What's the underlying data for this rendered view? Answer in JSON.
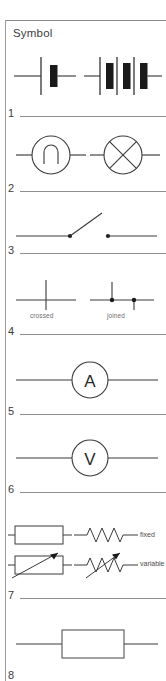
{
  "table": {
    "column_header": "Symbol",
    "rows": [
      {
        "number": "1",
        "symbols": [
          {
            "name": "cell",
            "label": ""
          },
          {
            "name": "battery",
            "label": ""
          }
        ]
      },
      {
        "number": "2",
        "symbols": [
          {
            "name": "lamp-filament",
            "label": ""
          },
          {
            "name": "lamp-indicator-cross",
            "label": ""
          }
        ]
      },
      {
        "number": "3",
        "symbols": [
          {
            "name": "switch-open",
            "label": ""
          }
        ]
      },
      {
        "number": "4",
        "symbols": [
          {
            "name": "wires-crossed",
            "label": "crossed"
          },
          {
            "name": "wires-joined",
            "label": "joined"
          }
        ]
      },
      {
        "number": "5",
        "symbols": [
          {
            "name": "ammeter",
            "label": "A"
          }
        ]
      },
      {
        "number": "6",
        "symbols": [
          {
            "name": "voltmeter",
            "label": "V"
          }
        ]
      },
      {
        "number": "7",
        "symbols": [
          {
            "name": "resistor-fixed-box",
            "label": ""
          },
          {
            "name": "resistor-fixed-zigzag",
            "label": "fixed"
          },
          {
            "name": "resistor-variable-box",
            "label": ""
          },
          {
            "name": "resistor-variable-zigzag",
            "label": "variable"
          }
        ]
      },
      {
        "number": "8",
        "symbols": [
          {
            "name": "component-box",
            "label": ""
          }
        ]
      }
    ]
  },
  "meters": {
    "ammeter_letter": "A",
    "voltmeter_letter": "V"
  },
  "junction_labels": {
    "crossed": "crossed",
    "joined": "joined"
  },
  "resistor_labels": {
    "fixed": "fixed",
    "variable": "variable"
  },
  "row_numbers": {
    "n1": "1",
    "n2": "2",
    "n3": "3",
    "n4": "4",
    "n5": "5",
    "n6": "6",
    "n7": "7",
    "n8": "8"
  },
  "colors": {
    "ink": "#222222",
    "rule": "#8f8f8f",
    "text": "#3c3c3c",
    "sublabel": "#6d6d6d",
    "background": "#ffffff"
  }
}
